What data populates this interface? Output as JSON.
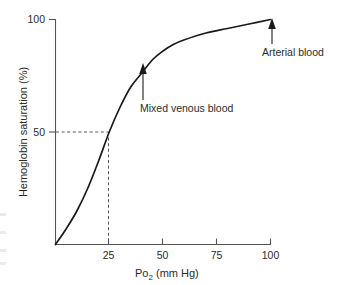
{
  "chart_data": {
    "type": "line",
    "title": "",
    "xlabel": "Po2 (mm Hg)",
    "xlabel_main": "Po",
    "xlabel_sub": "2",
    "xlabel_tail": " (mm Hg)",
    "ylabel": "Hemoglobin saturation (%)",
    "xlim": [
      0,
      100
    ],
    "ylim": [
      0,
      100
    ],
    "xticks": [
      25,
      50,
      75,
      100
    ],
    "xtick_labels": [
      "25",
      "50",
      "75",
      "100"
    ],
    "yticks": [
      50,
      100
    ],
    "ytick_labels": [
      "50",
      "100"
    ],
    "grid": false,
    "legend": "none",
    "series": [
      {
        "name": "Oxyhemoglobin dissociation curve",
        "x": [
          0,
          5,
          10,
          15,
          20,
          25,
          30,
          35,
          40,
          45,
          50,
          55,
          60,
          70,
          80,
          90,
          100
        ],
        "values": [
          0,
          7,
          15,
          25,
          37,
          50,
          61,
          70,
          76,
          82,
          86,
          89,
          91,
          94,
          96,
          98,
          100
        ]
      }
    ],
    "guide_lines": [
      {
        "name": "p50-guide",
        "style": "dashed",
        "x": 25,
        "y": 50
      }
    ],
    "annotations": [
      {
        "name": "mixed-venous-blood",
        "label": "Mixed venous blood",
        "point_x": 40,
        "point_y": 76,
        "arrow": "up"
      },
      {
        "name": "arterial-blood",
        "label": "Arterial blood",
        "point_x": 100,
        "point_y": 100,
        "arrow": "up"
      }
    ],
    "colors": {
      "curve": "#1a1a1a",
      "axis": "#555555",
      "text": "#2b2b2b",
      "guide": "#555555",
      "background": "#ffffff"
    }
  }
}
